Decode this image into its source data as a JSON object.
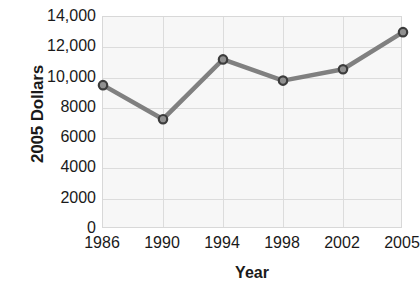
{
  "chart_data": {
    "type": "line",
    "title": "",
    "subtitle": "",
    "xlabel": "Year",
    "ylabel": "2005 Dollars",
    "categories": [
      "1986",
      "1990",
      "1994",
      "1998",
      "2002",
      "2005"
    ],
    "values": [
      9500,
      7250,
      11200,
      9800,
      10550,
      13000
    ],
    "series": [
      {
        "name": "2005 Dollars",
        "values": [
          9500,
          7250,
          11200,
          9800,
          10550,
          13000
        ]
      }
    ],
    "ylim": [
      0,
      14000
    ],
    "ytick_values": [
      14000,
      12000,
      10000,
      8000,
      6000,
      4000,
      2000,
      0
    ],
    "ytick_labels": [
      "14,000",
      "12,000",
      "10,000",
      "8000",
      "6000",
      "4000",
      "2000",
      "0"
    ],
    "xtick_labels": [
      "1986",
      "1990",
      "1994",
      "1998",
      "2002",
      "2005"
    ],
    "grid": true,
    "grid_axes": "both",
    "legend": false,
    "legend_position": "none",
    "markers": "circle",
    "colors": {
      "line": "#808080",
      "marker_fill": "#909090",
      "marker_edge": "#3c3c3c",
      "plot_background": "#f7f7f7",
      "gridline": "#dcdcdc",
      "axis_border": "#d8d8d8",
      "text": "#1a1a1a",
      "page_background": "#ffffff"
    }
  }
}
